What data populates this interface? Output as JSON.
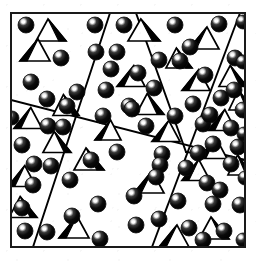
{
  "figure": {
    "title": "Two-phase polycrystalline microstructure schematic",
    "type": "schematic-diagram",
    "colors": {
      "background": "#ffffff",
      "ink": "#000000",
      "frame": "#1a1a1a",
      "sphere_fill": "#0d0d0d",
      "sphere_highlight": "#ffffff",
      "pyramid_face_light": "#ffffff",
      "pyramid_face_dark": "#000000"
    },
    "frame": {
      "x": 11,
      "y": 13,
      "width": 234,
      "height": 234,
      "stroke_width": 2
    },
    "legend_items": [
      {
        "symbol": "sphere",
        "label": ""
      },
      {
        "symbol": "pyramid",
        "label": ""
      }
    ],
    "counts": {
      "grains": 7,
      "spheres": 73,
      "pyramids": 26,
      "boundary_lines": 5
    },
    "boundaries": [
      {
        "name": "boundary-a",
        "x1": 110,
        "y1": 13,
        "x2": 33,
        "y2": 247
      },
      {
        "name": "boundary-b",
        "x1": 136,
        "y1": 13,
        "x2": 186,
        "y2": 152
      },
      {
        "name": "boundary-c",
        "x1": 240,
        "y1": 13,
        "x2": 152,
        "y2": 247
      },
      {
        "name": "boundary-d",
        "x1": 11,
        "y1": 100,
        "x2": 245,
        "y2": 160
      },
      {
        "name": "boundary-e",
        "x1": 186,
        "y1": 152,
        "x2": 245,
        "y2": 160
      }
    ],
    "spheres": [
      {
        "cx": 26,
        "cy": 25,
        "r": 8
      },
      {
        "cx": 95,
        "cy": 25,
        "r": 8
      },
      {
        "cx": 124,
        "cy": 25,
        "r": 8
      },
      {
        "cx": 175,
        "cy": 25,
        "r": 8
      },
      {
        "cx": 219,
        "cy": 24,
        "r": 8
      },
      {
        "cx": 243,
        "cy": 22,
        "r": 7
      },
      {
        "cx": 96,
        "cy": 52,
        "r": 8
      },
      {
        "cx": 117,
        "cy": 52,
        "r": 8
      },
      {
        "cx": 61,
        "cy": 58,
        "r": 8
      },
      {
        "cx": 159,
        "cy": 60,
        "r": 8
      },
      {
        "cx": 180,
        "cy": 61,
        "r": 8
      },
      {
        "cx": 235,
        "cy": 58,
        "r": 8
      },
      {
        "cx": 31,
        "cy": 82,
        "r": 8
      },
      {
        "cx": 77,
        "cy": 92,
        "r": 8
      },
      {
        "cx": 106,
        "cy": 90,
        "r": 8
      },
      {
        "cx": 154,
        "cy": 88,
        "r": 8
      },
      {
        "cx": 205,
        "cy": 75,
        "r": 8
      },
      {
        "cx": 234,
        "cy": 90,
        "r": 8
      },
      {
        "cx": 47,
        "cy": 99,
        "r": 8
      },
      {
        "cx": 129,
        "cy": 106,
        "r": 8
      },
      {
        "cx": 193,
        "cy": 104,
        "r": 8
      },
      {
        "cx": 221,
        "cy": 98,
        "r": 8
      },
      {
        "cx": 103,
        "cy": 116,
        "r": 8
      },
      {
        "cx": 132,
        "cy": 109,
        "r": 8
      },
      {
        "cx": 175,
        "cy": 116,
        "r": 8
      },
      {
        "cx": 243,
        "cy": 110,
        "r": 8
      },
      {
        "cx": 48,
        "cy": 126,
        "r": 8
      },
      {
        "cx": 63,
        "cy": 127,
        "r": 8
      },
      {
        "cx": 146,
        "cy": 126,
        "r": 8
      },
      {
        "cx": 203,
        "cy": 124,
        "r": 8
      },
      {
        "cx": 231,
        "cy": 128,
        "r": 8
      },
      {
        "cx": 22,
        "cy": 145,
        "r": 8
      },
      {
        "cx": 213,
        "cy": 144,
        "r": 8
      },
      {
        "cx": 238,
        "cy": 147,
        "r": 8
      },
      {
        "cx": 162,
        "cy": 154,
        "r": 8
      },
      {
        "cx": 198,
        "cy": 153,
        "r": 8
      },
      {
        "cx": 34,
        "cy": 164,
        "r": 8
      },
      {
        "cx": 51,
        "cy": 166,
        "r": 8
      },
      {
        "cx": 91,
        "cy": 160,
        "r": 8
      },
      {
        "cx": 160,
        "cy": 165,
        "r": 8
      },
      {
        "cx": 231,
        "cy": 164,
        "r": 8
      },
      {
        "cx": 70,
        "cy": 180,
        "r": 8
      },
      {
        "cx": 33,
        "cy": 185,
        "r": 8
      },
      {
        "cx": 117,
        "cy": 152,
        "r": 8
      },
      {
        "cx": 207,
        "cy": 183,
        "r": 8
      },
      {
        "cx": 245,
        "cy": 178,
        "r": 7
      },
      {
        "cx": 98,
        "cy": 204,
        "r": 8
      },
      {
        "cx": 134,
        "cy": 196,
        "r": 8
      },
      {
        "cx": 178,
        "cy": 201,
        "r": 8
      },
      {
        "cx": 213,
        "cy": 204,
        "r": 8
      },
      {
        "cx": 240,
        "cy": 205,
        "r": 8
      },
      {
        "cx": 22,
        "cy": 208,
        "r": 8
      },
      {
        "cx": 136,
        "cy": 225,
        "r": 8
      },
      {
        "cx": 159,
        "cy": 219,
        "r": 8
      },
      {
        "cx": 189,
        "cy": 228,
        "r": 8
      },
      {
        "cx": 224,
        "cy": 231,
        "r": 8
      },
      {
        "cx": 243,
        "cy": 240,
        "r": 7
      },
      {
        "cx": 25,
        "cy": 231,
        "r": 8
      },
      {
        "cx": 47,
        "cy": 232,
        "r": 8
      },
      {
        "cx": 100,
        "cy": 239,
        "r": 8
      },
      {
        "cx": 203,
        "cy": 240,
        "r": 8
      },
      {
        "cx": 72,
        "cy": 216,
        "r": 8
      },
      {
        "cx": 156,
        "cy": 177,
        "r": 8
      },
      {
        "cx": 186,
        "cy": 168,
        "r": 8
      },
      {
        "cx": 111,
        "cy": 69,
        "r": 8
      },
      {
        "cx": 67,
        "cy": 106,
        "r": 8
      },
      {
        "cx": 244,
        "cy": 134,
        "r": 7
      },
      {
        "cx": 243,
        "cy": 62,
        "r": 7
      },
      {
        "cx": 12,
        "cy": 118,
        "r": 7
      },
      {
        "cx": 190,
        "cy": 47,
        "r": 8
      },
      {
        "cx": 220,
        "cy": 190,
        "r": 8
      },
      {
        "cx": 210,
        "cy": 115,
        "r": 8
      },
      {
        "cx": 138,
        "cy": 73,
        "r": 8
      }
    ],
    "pyramids": [
      {
        "cx": 51,
        "cy": 30,
        "w": 30,
        "h": 22,
        "dark": "right"
      },
      {
        "cx": 144,
        "cy": 30,
        "w": 32,
        "h": 22,
        "dark": "right"
      },
      {
        "cx": 204,
        "cy": 38,
        "w": 30,
        "h": 22,
        "dark": "left"
      },
      {
        "cx": 35,
        "cy": 50,
        "w": 30,
        "h": 22,
        "dark": "left"
      },
      {
        "cx": 131,
        "cy": 76,
        "w": 28,
        "h": 21,
        "dark": "left"
      },
      {
        "cx": 196,
        "cy": 80,
        "w": 28,
        "h": 21,
        "dark": "left"
      },
      {
        "cx": 233,
        "cy": 76,
        "w": 28,
        "h": 21,
        "dark": "right"
      },
      {
        "cx": 66,
        "cy": 105,
        "w": 26,
        "h": 21,
        "dark": "right"
      },
      {
        "cx": 150,
        "cy": 104,
        "w": 28,
        "h": 21,
        "dark": "right"
      },
      {
        "cx": 28,
        "cy": 118,
        "w": 28,
        "h": 21,
        "dark": "left"
      },
      {
        "cx": 222,
        "cy": 120,
        "w": 28,
        "h": 21,
        "dark": "left"
      },
      {
        "cx": 57,
        "cy": 142,
        "w": 28,
        "h": 21,
        "dark": "right"
      },
      {
        "cx": 166,
        "cy": 131,
        "w": 28,
        "h": 21,
        "dark": "left"
      },
      {
        "cx": 213,
        "cy": 148,
        "w": 28,
        "h": 21,
        "dark": "left"
      },
      {
        "cx": 89,
        "cy": 159,
        "w": 30,
        "h": 22,
        "dark": "right"
      },
      {
        "cx": 196,
        "cy": 170,
        "w": 28,
        "h": 21,
        "dark": "left"
      },
      {
        "cx": 22,
        "cy": 176,
        "w": 28,
        "h": 21,
        "dark": "left"
      },
      {
        "cx": 149,
        "cy": 182,
        "w": 30,
        "h": 22,
        "dark": "left"
      },
      {
        "cx": 23,
        "cy": 207,
        "w": 28,
        "h": 21,
        "dark": "right"
      },
      {
        "cx": 74,
        "cy": 227,
        "w": 30,
        "h": 22,
        "dark": "left"
      },
      {
        "cx": 174,
        "cy": 236,
        "w": 30,
        "h": 22,
        "dark": "left"
      },
      {
        "cx": 214,
        "cy": 228,
        "w": 30,
        "h": 22,
        "dark": "right"
      },
      {
        "cx": 108,
        "cy": 130,
        "w": 26,
        "h": 20,
        "dark": "left"
      },
      {
        "cx": 179,
        "cy": 58,
        "w": 26,
        "h": 20,
        "dark": "right"
      },
      {
        "cx": 241,
        "cy": 100,
        "w": 24,
        "h": 20,
        "dark": "right"
      },
      {
        "cx": 240,
        "cy": 165,
        "w": 24,
        "h": 20,
        "dark": "right"
      }
    ]
  }
}
